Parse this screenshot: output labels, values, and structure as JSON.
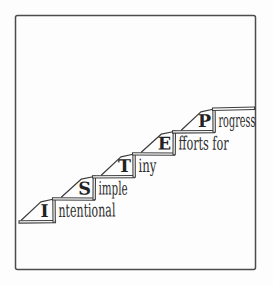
{
  "figure": {
    "type": "staircase-acronym-diagram",
    "steps": [
      {
        "letter": "I",
        "word": "ntentional"
      },
      {
        "letter": "S",
        "word": "imple"
      },
      {
        "letter": "T",
        "word": "iny"
      },
      {
        "letter": "E",
        "word": "fforts for"
      },
      {
        "letter": "P",
        "word": "rogress"
      }
    ],
    "colors": {
      "ink": "#3d3d3d",
      "letter_ink": "#222222",
      "word_ink": "#2d2d2d",
      "border": "#4c4c4c",
      "background": "#ffffff"
    }
  }
}
